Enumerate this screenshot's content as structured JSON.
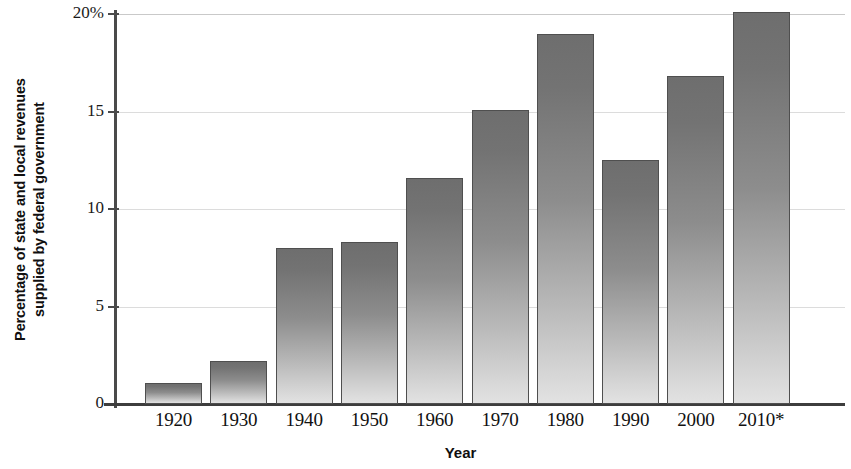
{
  "chart_data": {
    "type": "bar",
    "title": "",
    "xlabel": "Year",
    "ylabel": "Percentage of state and local revenues supplied by federal government",
    "ylabel_line1": "Percentage of state and local revenues",
    "ylabel_line2": "supplied by federal government",
    "categories": [
      "1920",
      "1930",
      "1940",
      "1950",
      "1960",
      "1970",
      "1980",
      "1990",
      "2000",
      "2010*"
    ],
    "values": [
      1.1,
      2.2,
      8.0,
      8.3,
      11.6,
      15.1,
      19.0,
      12.5,
      16.8,
      20.1
    ],
    "ytick_labels": [
      "20%",
      "15",
      "10",
      "5",
      "0"
    ],
    "ytick_values": [
      20,
      15,
      10,
      5,
      0
    ],
    "ylim": [
      0,
      20
    ],
    "grid": "horizontal",
    "legend": "none",
    "bar_color_top": "#6e6e6e",
    "bar_color_bottom": "#e2e2e2",
    "bar_border_color": "#4f4f4f",
    "axis_color": "#4a4a4a",
    "gridline_color": "#dcdcdc",
    "background": "#ffffff"
  }
}
